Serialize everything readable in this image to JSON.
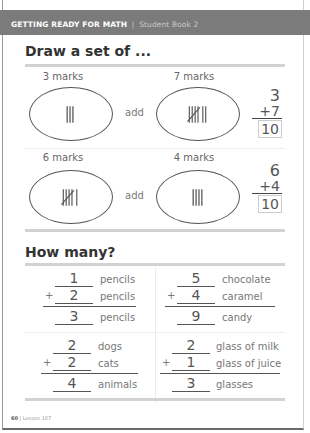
{
  "header": {
    "title": "GETTING READY FOR MATH",
    "separator": "|",
    "subtitle": "Student Book 2"
  },
  "draw_section": {
    "title": "Draw a set of ...",
    "problems": [
      {
        "left_label": "3 marks",
        "left_tally": 3,
        "connector": "add",
        "right_label": "7 marks",
        "right_tally": 7,
        "addend1": "3",
        "addend2": "+7",
        "answer": "10"
      },
      {
        "left_label": "6 marks",
        "left_tally": 6,
        "connector": "add",
        "right_label": "4 marks",
        "right_tally": 4,
        "addend1": "6",
        "addend2": "+4",
        "answer": "10"
      }
    ]
  },
  "how_many_section": {
    "title": "How many?",
    "problems": [
      {
        "a": "1",
        "a_unit": "pencils",
        "plus": "+",
        "b": "2",
        "b_unit": "pencils",
        "sum": "3",
        "sum_unit": "pencils"
      },
      {
        "a": "5",
        "a_unit": "chocolate",
        "plus": "+",
        "b": "4",
        "b_unit": "caramel",
        "sum": "9",
        "sum_unit": "candy"
      },
      {
        "a": "2",
        "a_unit": "dogs",
        "plus": "+",
        "b": "2",
        "b_unit": "cats",
        "sum": "4",
        "sum_unit": "animals"
      },
      {
        "a": "2",
        "a_unit": "glass of milk",
        "plus": "+",
        "b": "1",
        "b_unit": "glass of juice",
        "sum": "3",
        "sum_unit": "glasses"
      }
    ]
  },
  "footer": {
    "page_number": "60",
    "separator": "|",
    "lesson": "Lesson 107"
  }
}
